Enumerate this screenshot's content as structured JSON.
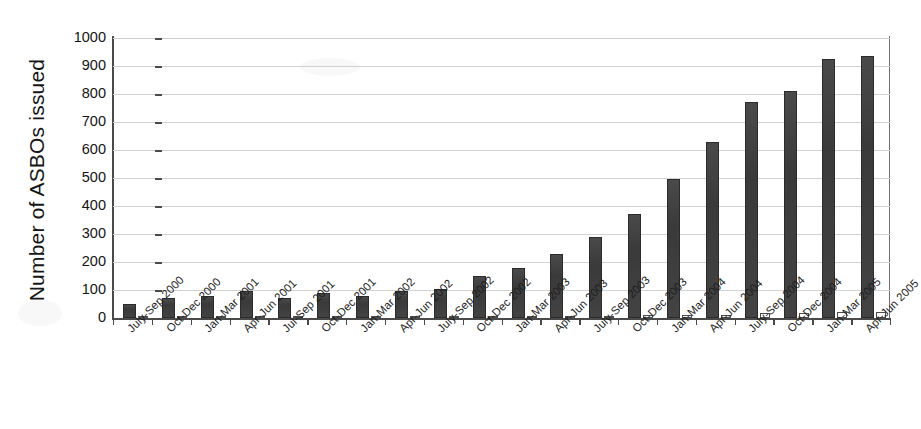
{
  "chart_data": {
    "type": "bar",
    "title": "",
    "xlabel": "",
    "ylabel": "Number of ASBOs issued",
    "ylim": [
      0,
      1000
    ],
    "ytick_step": 100,
    "yticks": [
      0,
      100,
      200,
      300,
      400,
      500,
      600,
      700,
      800,
      900,
      1000
    ],
    "grid": true,
    "legend": "none",
    "categories": [
      "July-Sep 2000",
      "Oct-Dec 2000",
      "Jan-Mar 2001",
      "Apr-Jun 2001",
      "Jul-Sep 2001",
      "Oct-Dec 2001",
      "Jan-Mar 2002",
      "Apr-Jun 2002",
      "July-Sep 2002",
      "Oct-Dec 2002",
      "Jan-Mar 2003",
      "Apr-Jun 2003",
      "July-Sep 2003",
      "Oct-Dec 2003",
      "Jan-Mar 2004",
      "Apr-Jun 2004",
      "July-Sep 2004",
      "Oct-Dec 2004",
      "Jan-Mar 2005",
      "Apr-Jun 2005"
    ],
    "series": [
      {
        "name": "ASBOs issued",
        "style": "filled-dark",
        "values": [
          50,
          70,
          80,
          95,
          70,
          90,
          80,
          98,
          103,
          150,
          180,
          230,
          290,
          370,
          495,
          630,
          770,
          810,
          925,
          935
        ]
      },
      {
        "name": "Secondary series",
        "style": "outlined-white",
        "values": [
          2,
          3,
          2,
          4,
          3,
          4,
          3,
          5,
          5,
          6,
          6,
          7,
          8,
          9,
          10,
          12,
          18,
          18,
          20,
          20
        ]
      }
    ]
  }
}
